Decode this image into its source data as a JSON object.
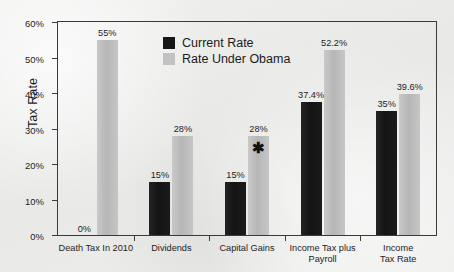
{
  "chart_data": {
    "type": "bar",
    "title": "",
    "xlabel": "",
    "ylabel": "Tax Rate",
    "ylim": [
      0,
      60
    ],
    "ytick_labels": [
      "0%",
      "10%",
      "20%",
      "30%",
      "40%",
      "50%",
      "60%"
    ],
    "ytick_values": [
      0,
      10,
      20,
      30,
      40,
      50,
      60
    ],
    "grid": false,
    "legend_position": "upper-center",
    "categories": [
      "Death Tax In 2010",
      "Dividends",
      "Capital Gains",
      "Income Tax plus\nPayroll",
      "Income Tax Rate"
    ],
    "series": [
      {
        "name": "Current Rate",
        "color": "#161616",
        "values": [
          0,
          15,
          15,
          37.4,
          35
        ],
        "data_labels": [
          "0%",
          "15%",
          "15%",
          "37.4%",
          "35%"
        ]
      },
      {
        "name": "Rate Under Obama",
        "color": "#c2c2c2",
        "values": [
          55,
          28,
          28,
          52.2,
          39.6
        ],
        "data_labels": [
          "55%",
          "28%",
          "28%",
          "52.2%",
          "39.6%"
        ]
      }
    ],
    "annotations": [
      {
        "text": "✱",
        "name": "asterisk-annotation",
        "category": "Capital Gains",
        "series": "Rate Under Obama"
      }
    ]
  },
  "legend": {
    "items": [
      {
        "label": "Current Rate",
        "swatch": "black-swatch-icon"
      },
      {
        "label": "Rate Under Obama",
        "swatch": "gray-swatch-icon"
      }
    ]
  }
}
